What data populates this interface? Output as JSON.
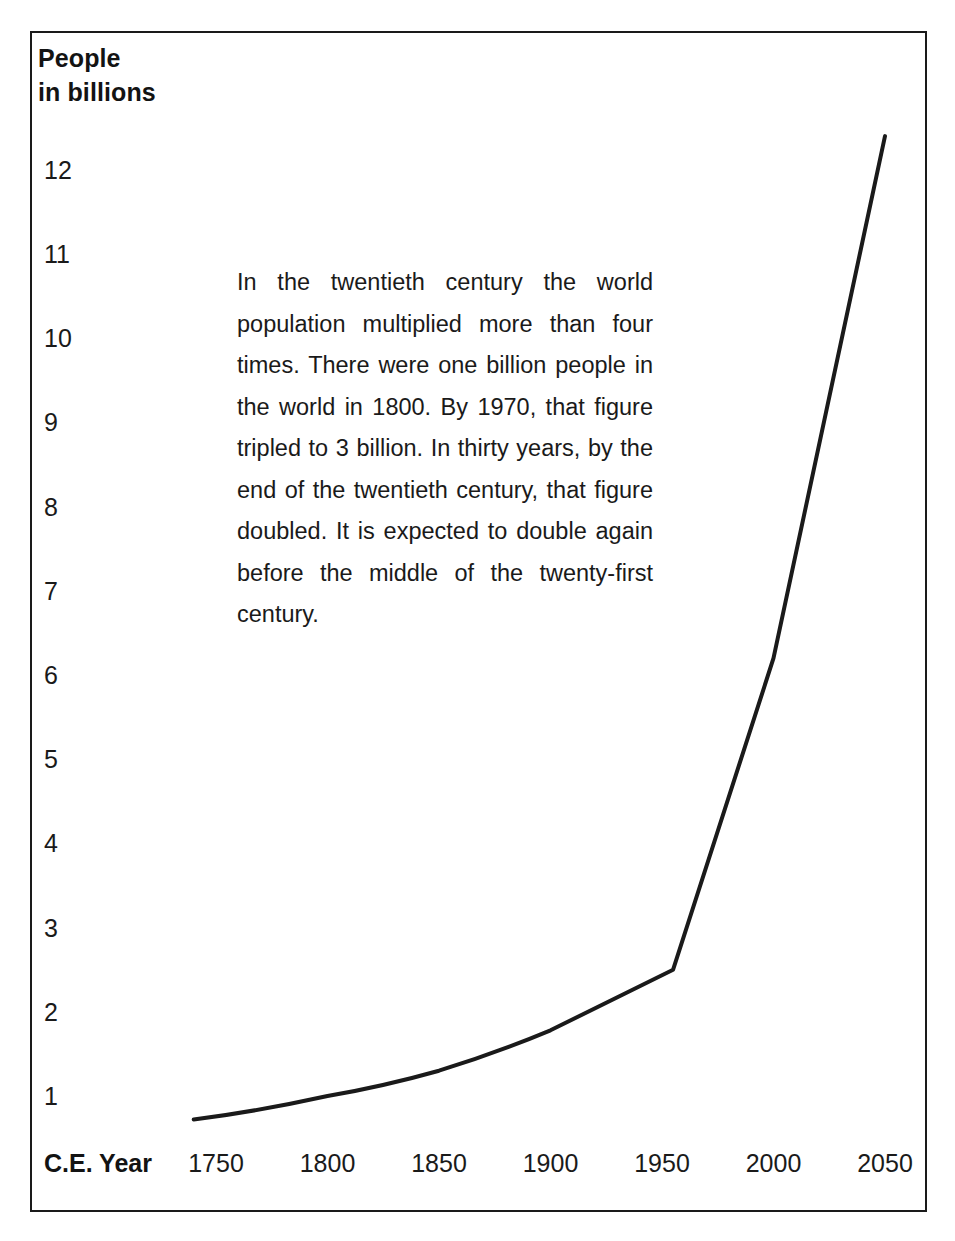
{
  "figure": {
    "border_color": "#1a1a1a",
    "background": "#ffffff"
  },
  "y_axis": {
    "title": "People\nin billions",
    "ticks": [
      "12",
      "11",
      "10",
      "9",
      "8",
      "7",
      "6",
      "5",
      "4",
      "3",
      "2",
      "1"
    ]
  },
  "x_axis": {
    "name": "C.E. Year",
    "ticks": [
      "1750",
      "1800",
      "1850",
      "1900",
      "1950",
      "2000",
      "2050"
    ]
  },
  "annotation": {
    "text": "In the twentieth century the world population multiplied more than four times. There were one billion people in the world in 1800. By 1970, that figure tripled to 3 billion. In thirty years, by the end of the twentieth century, that figure doubled. It is expected to double again before the middle of the twenty-first century."
  },
  "chart_data": {
    "type": "line",
    "title": "",
    "subtitle": "",
    "xlabel": "C.E. Year",
    "ylabel": "People in billions",
    "xlim": [
      1740,
      2050
    ],
    "ylim": [
      0,
      12.4
    ],
    "grid": false,
    "legend": "none",
    "xticks": [
      1750,
      1800,
      1850,
      1900,
      1950,
      2000,
      2050
    ],
    "yticks": [
      1,
      2,
      3,
      4,
      5,
      6,
      7,
      8,
      9,
      10,
      11,
      12
    ],
    "line_color": "#1a1a1a",
    "line_width": 4,
    "series": [
      {
        "name": "World population",
        "x": [
          1740,
          1800,
          1850,
          1900,
          1955,
          2000,
          2050
        ],
        "values": [
          0.72,
          1.0,
          1.3,
          1.78,
          2.5,
          6.2,
          12.4
        ]
      }
    ],
    "annotations": [
      "In the twentieth century the world population multiplied more than four times. There were one billion people in the world in 1800. By 1970, that figure tripled to 3 billion. In thirty years, by the end of the twentieth century, that figure doubled. It is expected to double again before the middle of the twenty-first century."
    ]
  }
}
